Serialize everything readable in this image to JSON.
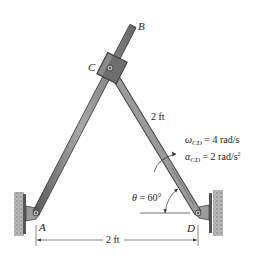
{
  "diagram": {
    "type": "mechanism",
    "points": {
      "A": "A",
      "B": "B",
      "C": "C",
      "D": "D"
    },
    "link_cd_length": "2 ft",
    "ground_distance": "2 ft",
    "omega": {
      "symbol": "ω",
      "sub": "CD",
      "value": " = 4 rad/s"
    },
    "alpha": {
      "symbol": "α",
      "sub": "CD",
      "value": " = 2 rad/s",
      "sup": "2"
    },
    "theta": {
      "symbol": "θ",
      "value": " = 60°"
    },
    "colors": {
      "rod_fill": "#8a8a8a",
      "rod_edge": "#3a3a3a",
      "collar_fill": "#6e6e6e",
      "wall_fill": "#9a9a9a",
      "line": "#333333"
    }
  }
}
